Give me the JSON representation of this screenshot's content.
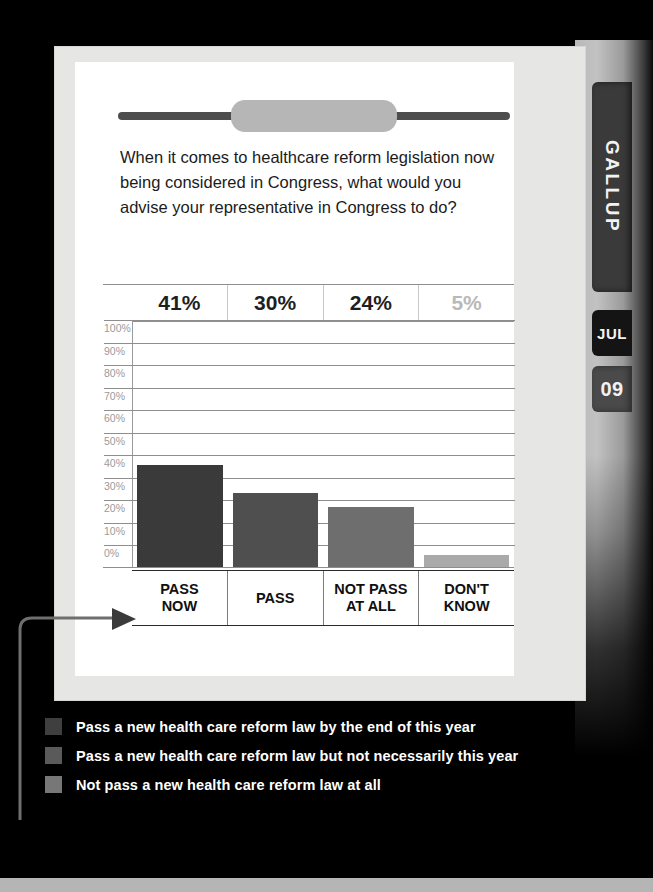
{
  "background_color": "#000000",
  "side_tabs": {
    "brand_label": "GALLUP",
    "month_label": "JUL",
    "year_label": "09"
  },
  "card": {
    "question": "When it comes to healthcare reform legislation now being considered in Congress, what would you advise your representative in Congress to do?"
  },
  "chart_data": {
    "type": "bar",
    "title": "When it comes to healthcare reform legislation now being considered in Congress, what would you advise your representative in Congress to do?",
    "categories": [
      "PASS NOW",
      "PASS",
      "NOT PASS AT ALL",
      "DON'T KNOW"
    ],
    "values": [
      41,
      30,
      24,
      5
    ],
    "value_labels": [
      "41%",
      "30%",
      "24%",
      "5%"
    ],
    "series": [
      {
        "name": "Pass a new health care reform law by the end of this year",
        "category": "PASS NOW",
        "value": 41,
        "color": "#3a3a3a"
      },
      {
        "name": "Pass a new health care reform law but not necessarily this year",
        "category": "PASS",
        "value": 30,
        "color": "#4f4f4f"
      },
      {
        "name": "Not pass a new health care reform law at all",
        "category": "NOT PASS AT ALL",
        "value": 24,
        "color": "#6e6e6e"
      },
      {
        "name": "DON'T KNOW",
        "category": "DON'T KNOW",
        "value": 5,
        "color": "#aaaaaa"
      }
    ],
    "ytick_labels": [
      "100%",
      "90%",
      "80%",
      "70%",
      "60%",
      "50%",
      "40%",
      "30%",
      "20%",
      "10%",
      "0%"
    ],
    "ytick_values": [
      100,
      90,
      80,
      70,
      60,
      50,
      40,
      30,
      20,
      10,
      0
    ],
    "ylim": [
      0,
      100
    ],
    "xlabel": "",
    "ylabel": "",
    "grid": true,
    "legend_position": "below-chart"
  },
  "legend": {
    "items": [
      {
        "label": "Pass a new health care reform law by the end of this year",
        "color": "#3f3f3f"
      },
      {
        "label": "Pass a new health care reform law but not necessarily this year",
        "color": "#5a5a5a"
      },
      {
        "label": "Not pass a new health care reform law at all",
        "color": "#777777"
      }
    ]
  }
}
